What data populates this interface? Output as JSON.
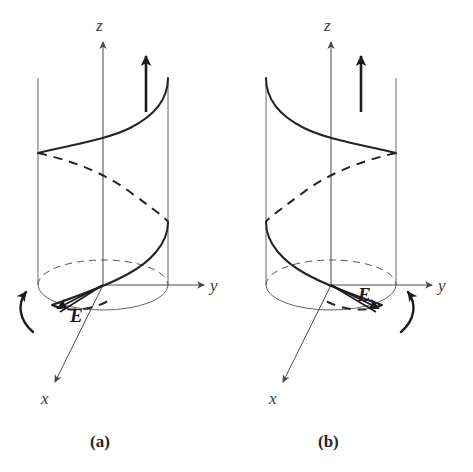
{
  "figure": {
    "background_color": "#ffffff",
    "line_color": "#56565a",
    "curve_color": "#242428",
    "accent_color": "#1b1b1f",
    "panels": [
      {
        "id": "panel-a",
        "caption": "(a)",
        "handedness": "left-hand circular polarization",
        "axes": [
          {
            "name": "z-axis",
            "label": "z",
            "direction": "up"
          },
          {
            "name": "y-axis",
            "label": "y",
            "direction": "right"
          },
          {
            "name": "x-axis",
            "label": "x",
            "direction": "down-left"
          }
        ],
        "field_label": "E",
        "field_vector_direction": "down-left",
        "propagation_arrow": {
          "name": "propagation-arrow",
          "direction": "up"
        },
        "rotation_arrow": {
          "name": "rotation-arrow",
          "side": "left",
          "sense": "counterclockwise-viewed-from-plus-z"
        },
        "helix": {
          "turns": 1.5,
          "solid_segments": 2,
          "dashed_segments": 2,
          "winding": "left-handed"
        },
        "cylinder": {
          "left_wall_x": 38,
          "right_wall_x": 168,
          "top_y": 78,
          "base_center_y": 285,
          "ellipse_ry": 25
        }
      },
      {
        "id": "panel-b",
        "caption": "(b)",
        "handedness": "right-hand circular polarization",
        "axes": [
          {
            "name": "z-axis",
            "label": "z",
            "direction": "up"
          },
          {
            "name": "y-axis",
            "label": "y",
            "direction": "right"
          },
          {
            "name": "x-axis",
            "label": "x",
            "direction": "down-left"
          }
        ],
        "field_label": "E",
        "field_vector_direction": "down-right",
        "propagation_arrow": {
          "name": "propagation-arrow",
          "direction": "up"
        },
        "rotation_arrow": {
          "name": "rotation-arrow",
          "side": "right",
          "sense": "clockwise-viewed-from-plus-z"
        },
        "helix": {
          "turns": 1.5,
          "solid_segments": 2,
          "dashed_segments": 2,
          "winding": "right-handed"
        },
        "cylinder": {
          "left_wall_x": 266,
          "right_wall_x": 396,
          "top_y": 78,
          "base_center_y": 285,
          "ellipse_ry": 25
        }
      }
    ]
  }
}
